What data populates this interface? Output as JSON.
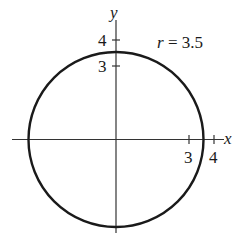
{
  "diagram": {
    "type": "polar-circle",
    "equation_label": "r = 3.5",
    "equation_parts": {
      "var": "r",
      "eq": " = 3.5"
    },
    "radius": 3.5,
    "axes": {
      "x_label": "x",
      "y_label": "y",
      "x_ticks": [
        {
          "value": 3,
          "label": "3"
        },
        {
          "value": 4,
          "label": "4"
        }
      ],
      "y_ticks": [
        {
          "value": 3,
          "label": "3"
        },
        {
          "value": 4,
          "label": "4"
        }
      ]
    },
    "colors": {
      "stroke": "#1a1a1a",
      "axis": "#333333",
      "background": "#ffffff"
    }
  }
}
